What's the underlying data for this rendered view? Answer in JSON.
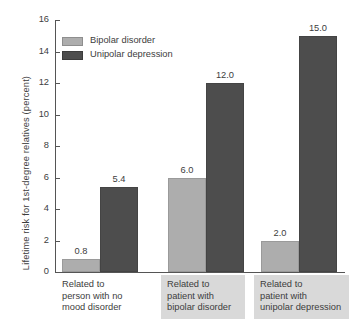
{
  "chart_data": {
    "type": "bar",
    "title": "",
    "xlabel": "",
    "ylabel": "Lifetime risk for 1st-degree relatives (percent)",
    "ylim": [
      0,
      16
    ],
    "yticks": [
      0,
      2,
      4,
      6,
      8,
      10,
      12,
      14,
      16
    ],
    "ytick_labels": [
      "0",
      "2",
      "4",
      "6",
      "8",
      "10",
      "12",
      "14",
      "16"
    ],
    "grid": false,
    "legend_position": "top-left",
    "categories": [
      "Related to person with no mood disorder",
      "Related to patient with bipolar disorder",
      "Related to patient with unipolar depression"
    ],
    "category_lines": [
      [
        "Related to",
        "person with no",
        "mood disorder"
      ],
      [
        "Related to",
        "patient with",
        "bipolar disorder"
      ],
      [
        "Related to",
        "patient with",
        "unipolar depression"
      ]
    ],
    "category_shaded": [
      false,
      true,
      true
    ],
    "series": [
      {
        "name": "Bipolar disorder",
        "color": "#adadad",
        "values": [
          0.8,
          6.0,
          2.0
        ],
        "value_labels": [
          "0.8",
          "6.0",
          "2.0"
        ]
      },
      {
        "name": "Unipolar depression",
        "color": "#4d4d4d",
        "values": [
          5.4,
          12.0,
          15.0
        ],
        "value_labels": [
          "5.4",
          "12.0",
          "15.0"
        ]
      }
    ]
  },
  "legend": {
    "items": [
      {
        "label": "Bipolar disorder",
        "swatch": "light"
      },
      {
        "label": "Unipolar depression",
        "swatch": "dark"
      }
    ]
  },
  "axis": {
    "y_title": "Lifetime risk for 1st-degree relatives (percent)",
    "ticks": [
      "16",
      "14",
      "12",
      "10",
      "8",
      "6",
      "4",
      "2",
      "0"
    ]
  }
}
